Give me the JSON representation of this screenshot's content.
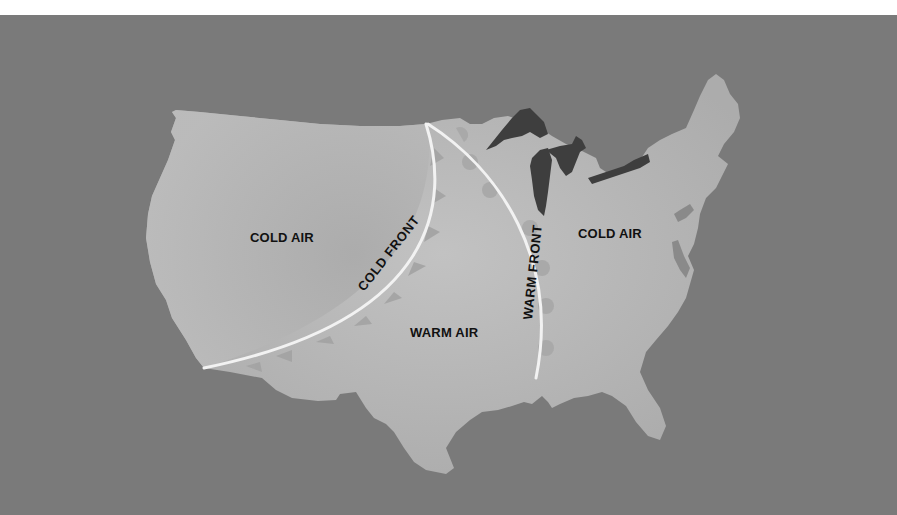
{
  "map": {
    "title": "Weather fronts over the contiguous United States",
    "colors": {
      "background": "#7a7a7a",
      "land": "#b4b4b4",
      "land_highlight": "#c4c4c4",
      "lakes": "#3e3e3e",
      "front_line": "#f2f2f2",
      "front_symbol": "#a3a3a3",
      "label_text": "#111111"
    },
    "regions": [
      {
        "id": "west",
        "label": "COLD AIR"
      },
      {
        "id": "central",
        "label": "WARM AIR"
      },
      {
        "id": "east",
        "label": "COLD AIR"
      }
    ],
    "fronts": [
      {
        "id": "cold-front",
        "label": "COLD FRONT",
        "symbol": "triangle"
      },
      {
        "id": "warm-front",
        "label": "WARM FRONT",
        "symbol": "semicircle"
      }
    ]
  }
}
